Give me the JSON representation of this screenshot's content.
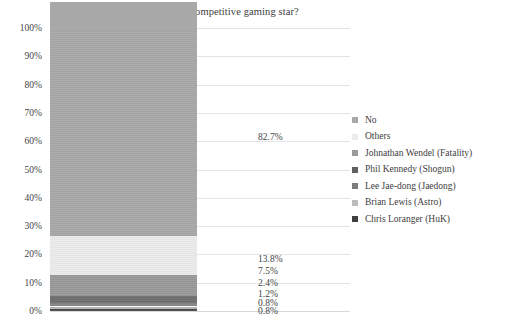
{
  "chart_data": {
    "type": "bar",
    "subtype": "stacked-100-percent",
    "title": "Do you know any competitive gaming star?",
    "xlabel": "",
    "ylabel": "",
    "ylim": [
      0,
      100
    ],
    "grid": true,
    "legend_position": "right",
    "categories": [
      "Do you know any competitive gaming star?"
    ],
    "y_ticks": [
      "0%",
      "10%",
      "20%",
      "30%",
      "40%",
      "50%",
      "60%",
      "70%",
      "80%",
      "90%",
      "100%"
    ],
    "y_tick_values": [
      0,
      10,
      20,
      30,
      40,
      50,
      60,
      70,
      80,
      90,
      100
    ],
    "series": [
      {
        "name": "No",
        "values": [
          82.7
        ],
        "label": "82.7%",
        "color": "#a8a8a8"
      },
      {
        "name": "Others",
        "values": [
          13.8
        ],
        "label": "13.8%",
        "color": "#ececec"
      },
      {
        "name": "Johnathan Wendel (Fatality)",
        "values": [
          7.5
        ],
        "label": "7.5%",
        "color": "#9a9a9a"
      },
      {
        "name": "Phil Kennedy (Shogun)",
        "values": [
          2.4
        ],
        "label": "2.4%",
        "color": "#6f6f6f"
      },
      {
        "name": "Lee Jae-dong (Jaedong)",
        "values": [
          1.2
        ],
        "label": "1.2%",
        "color": "#858585"
      },
      {
        "name": "Brian Lewis (Astro)",
        "values": [
          0.8
        ],
        "label": "0.8%",
        "color": "#b5b5b5"
      },
      {
        "name": "Chris Loranger (HuK)",
        "values": [
          0.8
        ],
        "label": "0.8%",
        "color": "#4a4a4a"
      }
    ],
    "segments_bottom_to_top": [
      {
        "name": "Chris Loranger (HuK)",
        "value": 0.8,
        "label": "0.8%",
        "color": "#4a4a4a"
      },
      {
        "name": "Brian Lewis (Astro)",
        "value": 0.8,
        "label": "0.8%",
        "color": "#b5b5b5"
      },
      {
        "name": "Lee Jae-dong (Jaedong)",
        "value": 1.2,
        "label": "1.2%",
        "color": "#858585"
      },
      {
        "name": "Phil Kennedy (Shogun)",
        "value": 2.4,
        "label": "2.4%",
        "color": "#6f6f6f"
      },
      {
        "name": "Johnathan Wendel (Fatality)",
        "value": 7.5,
        "label": "7.5%",
        "color": "#9a9a9a"
      },
      {
        "name": "Others",
        "value": 13.8,
        "label": "13.8%",
        "color": "#ececec"
      },
      {
        "name": "No",
        "value": 82.7,
        "label": "82.7%",
        "color": "#a8a8a8"
      }
    ],
    "value_labels": [
      "82.7%",
      "13.8%",
      "7.5%",
      "2.4%",
      "1.2%",
      "0.8%",
      "0.8%"
    ]
  },
  "legend": {
    "items": [
      {
        "label": "No",
        "color": "#a8a8a8"
      },
      {
        "label": "Others",
        "color": "#ececec"
      },
      {
        "label": "Johnathan Wendel (Fatality)",
        "color": "#9a9a9a"
      },
      {
        "label": "Phil Kennedy (Shogun)",
        "color": "#5f5f5f"
      },
      {
        "label": "Lee Jae-dong (Jaedong)",
        "color": "#7d7d7d"
      },
      {
        "label": "Brian Lewis (Astro)",
        "color": "#bdbdbd"
      },
      {
        "label": "Chris Loranger (HuK)",
        "color": "#3f3f3f"
      }
    ]
  }
}
